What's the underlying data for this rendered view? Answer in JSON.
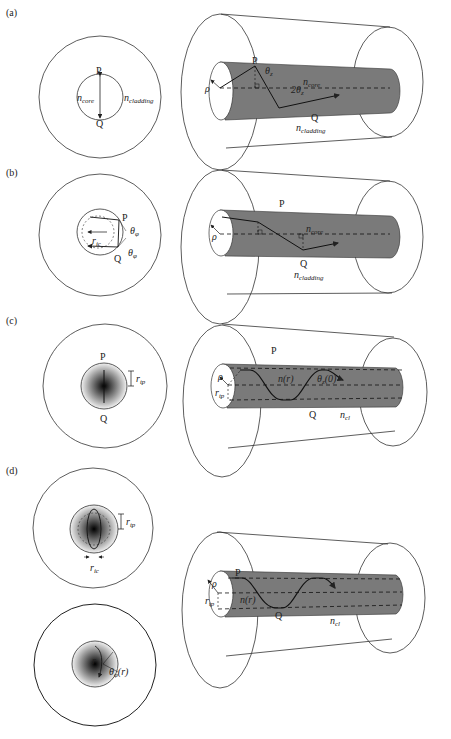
{
  "panels": [
    {
      "id": "a",
      "label": "(a)",
      "cross_section": {
        "top_point": "P",
        "bottom_point": "Q",
        "core_label": "n",
        "core_sub": "core",
        "cladding_label": "n",
        "cladding_sub": "cladding"
      },
      "fiber": {
        "point_p": "P",
        "point_q": "Q",
        "radius_label": "ρ",
        "angle_label_1": "θ",
        "angle_sub_1": "z",
        "angle_label_2": "2θ",
        "angle_sub_2": "z",
        "core_label": "n",
        "core_sub": "core",
        "cladding_label": "n",
        "cladding_sub": "cladding"
      }
    },
    {
      "id": "b",
      "label": "(b)",
      "cross_section": {
        "top_point": "P",
        "bottom_point": "Q",
        "caustic_label": "r",
        "caustic_sub": "ic",
        "angle_label_1": "θ",
        "angle_sub_1": "φ",
        "angle_label_2": "θ",
        "angle_sub_2": "φ"
      },
      "fiber": {
        "point_p": "P",
        "point_q": "Q",
        "radius_label": "ρ",
        "core_label": "n",
        "core_sub": "core",
        "cladding_label": "n",
        "cladding_sub": "cladding"
      }
    },
    {
      "id": "c",
      "label": "(c)",
      "cross_section": {
        "top_point": "P",
        "bottom_point": "Q",
        "turning_label": "r",
        "turning_sub": "tp"
      },
      "fiber": {
        "point_p": "P",
        "point_q": "Q",
        "radius_label": "ρ",
        "turning_label": "r",
        "turning_sub": "tp",
        "index_label": "n(r)",
        "angle_label": "θ",
        "angle_sub": "z",
        "angle_arg": "(0)",
        "cladding_label": "n",
        "cladding_sub": "cl"
      }
    },
    {
      "id": "d",
      "label": "(d)",
      "cross_section_top": {
        "turning_label": "r",
        "turning_sub": "tp",
        "caustic_label": "r",
        "caustic_sub": "ic"
      },
      "cross_section_bottom": {
        "radius_label": "r",
        "angle_label": "θ",
        "angle_sub": "φ",
        "angle_arg": "(r)"
      },
      "fiber": {
        "point_p": "P",
        "point_q": "Q",
        "radius_label": "ρ",
        "turning_label": "r",
        "turning_sub": "tp",
        "index_label": "n(r)",
        "cladding_label": "n",
        "cladding_sub": "cl"
      }
    }
  ],
  "colors": {
    "core_fill": "#7a7a7a",
    "line": "#333333",
    "background": "#ffffff"
  }
}
